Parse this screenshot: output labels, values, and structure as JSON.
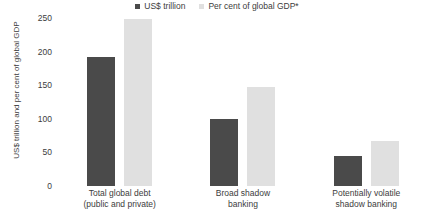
{
  "chart_data": {
    "type": "bar",
    "title": "",
    "subtitle": "",
    "xlabel": "",
    "ylabel": "US$ trillion and per cent of global GDP",
    "ylim": [
      0,
      250
    ],
    "yticks": [
      250,
      200,
      150,
      100,
      50,
      0
    ],
    "grid": false,
    "legend_position": "top-center",
    "categories": [
      "Total global debt (public and private)",
      "Broad shadow banking",
      "Potentially volatile shadow banking"
    ],
    "category_lines": [
      [
        "Total global debt",
        "(public and private)"
      ],
      [
        "Broad shadow",
        "banking"
      ],
      [
        "Potentially volatile",
        "shadow banking"
      ]
    ],
    "series": [
      {
        "name": "US$ trillion",
        "color": "#4a4a4a",
        "values": [
          192,
          100,
          45
        ]
      },
      {
        "name": "Per cent of global GDP*",
        "color": "#e0e0e0",
        "values": [
          248,
          148,
          67
        ]
      }
    ],
    "annotations": []
  }
}
